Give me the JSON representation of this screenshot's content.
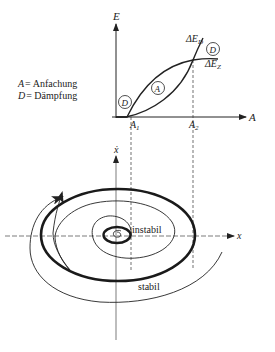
{
  "top_plot": {
    "y_axis_label": "E",
    "x_axis_label": "A",
    "tick_A1": "A",
    "tick_A1_sub": "1",
    "tick_A2": "A",
    "tick_A2_sub": "2",
    "curve_damping_label": "ΔE",
    "curve_damping_sub": "D",
    "curve_excitation_label": "ΔE",
    "curve_excitation_sub": "Z",
    "region_marker_D_top": "D",
    "region_marker_A": "A",
    "region_marker_D_bottom": "D"
  },
  "legend": {
    "line1_symbol": "A",
    "line1_text": "= Anfachung",
    "line2_symbol": "D",
    "line2_text": "= Dämpfung"
  },
  "phase_plot": {
    "x_axis_label": "x",
    "y_axis_label": "ẋ",
    "label_unstable": "instabil",
    "label_stable": "stabil"
  },
  "colors": {
    "ink": "#222222",
    "background": "#ffffff"
  }
}
